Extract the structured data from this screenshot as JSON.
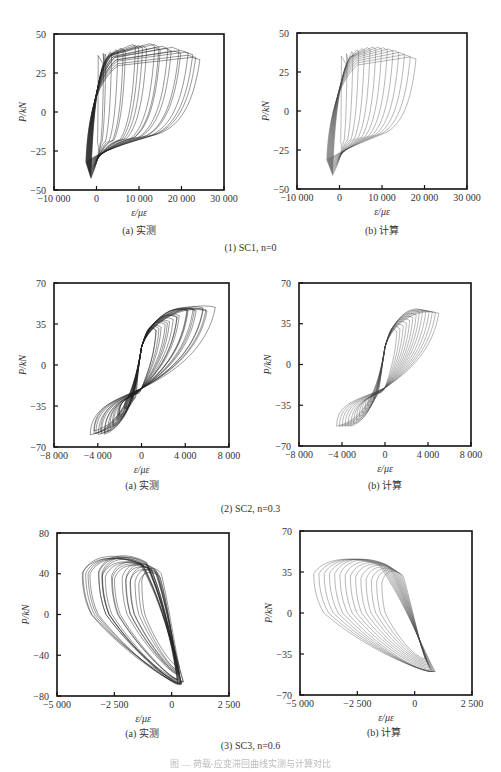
{
  "figure": {
    "groups": [
      {
        "caption": "(1) SC1, n=0"
      },
      {
        "caption": "(2) SC2, n=0.3"
      },
      {
        "caption": "(3) SC3, n=0.6"
      }
    ],
    "bottom_caption": "图 — 荷载-应变滞回曲线实测与计算对比"
  },
  "chart_data": [
    {
      "type": "line",
      "id": "sc1-a",
      "title": "(a) 实测",
      "subtitle": "Measured hysteresis, SC1 n=0",
      "xlabel": "ε/με",
      "ylabel": "P/kN",
      "xlim": [
        -10000,
        30000
      ],
      "ylim": [
        -50,
        50
      ],
      "xticks": [
        "-10 000",
        "0",
        "10 000",
        "20 000",
        "30 000"
      ],
      "xtick_values": [
        -10000,
        0,
        10000,
        20000,
        30000
      ],
      "yticks": [
        "50",
        "25",
        "0",
        "-25",
        "-50"
      ],
      "ytick_values": [
        50,
        25,
        0,
        -25,
        -50
      ],
      "grid": false,
      "legend": null,
      "envelope": {
        "peak_positive_kN": 43,
        "peak_negative_kN": -43,
        "max_strain": 25000,
        "min_strain": -2500
      },
      "loop_peaks": [
        [
          2000,
          37
        ],
        [
          5000,
          39
        ],
        [
          9000,
          40
        ],
        [
          13000,
          43
        ],
        [
          15000,
          38
        ],
        [
          20000,
          40
        ],
        [
          22000,
          37
        ],
        [
          25000,
          39
        ]
      ]
    },
    {
      "type": "line",
      "id": "sc1-b",
      "title": "(b) 计算",
      "subtitle": "Calculated hysteresis, SC1 n=0",
      "xlabel": "ε/με",
      "ylabel": "P/kN",
      "xlim": [
        -10000,
        30000
      ],
      "ylim": [
        -50,
        50
      ],
      "xticks": [
        "-10 000",
        "0",
        "10 000",
        "20 000",
        "30 000"
      ],
      "xtick_values": [
        -10000,
        0,
        10000,
        20000,
        30000
      ],
      "yticks": [
        "50",
        "25",
        "0",
        "-25",
        "-50"
      ],
      "ytick_values": [
        50,
        25,
        0,
        -25,
        -50
      ],
      "grid": false,
      "legend": null,
      "envelope": {
        "peak_positive_kN": 41,
        "peak_negative_kN": -42,
        "max_strain": 18000,
        "min_strain": -3000
      },
      "loop_peaks": [
        [
          4000,
          35
        ],
        [
          6000,
          37
        ],
        [
          8000,
          39
        ],
        [
          10000,
          41
        ],
        [
          12000,
          37
        ],
        [
          14000,
          34
        ],
        [
          16000,
          31
        ],
        [
          18000,
          30
        ]
      ]
    },
    {
      "type": "line",
      "id": "sc2-a",
      "title": "(a) 实测",
      "subtitle": "Measured hysteresis, SC2 n=0.3",
      "xlabel": "ε/με",
      "ylabel": "P/kN",
      "xlim": [
        -8000,
        8000
      ],
      "ylim": [
        -70,
        70
      ],
      "xticks": [
        "-8 000",
        "-4 000",
        "0",
        "4 000",
        "8 000"
      ],
      "xtick_values": [
        -8000,
        -4000,
        0,
        4000,
        8000
      ],
      "yticks": [
        "70",
        "35",
        "0",
        "-35",
        "-70"
      ],
      "ytick_values": [
        70,
        35,
        0,
        -35,
        -70
      ],
      "grid": false,
      "legend": null,
      "envelope": {
        "peak_positive_kN": 53,
        "peak_negative_kN": -58,
        "max_strain": 6500,
        "min_strain": -4600
      }
    },
    {
      "type": "line",
      "id": "sc2-b",
      "title": "(b) 计算",
      "subtitle": "Calculated hysteresis, SC2 n=0.3",
      "xlabel": "ε/με",
      "ylabel": "P/kN",
      "xlim": [
        -8000,
        8000
      ],
      "ylim": [
        -70,
        70
      ],
      "xticks": [
        "-8 000",
        "-4 000",
        "0",
        "4 000",
        "8 000"
      ],
      "xtick_values": [
        -8000,
        -4000,
        0,
        4000,
        8000
      ],
      "yticks": [
        "70",
        "35",
        "0",
        "-35",
        "-70"
      ],
      "ytick_values": [
        70,
        35,
        0,
        -35,
        -70
      ],
      "grid": false,
      "legend": null,
      "envelope": {
        "peak_positive_kN": 52,
        "peak_negative_kN": -53,
        "max_strain": 5000,
        "min_strain": -4500
      }
    },
    {
      "type": "line",
      "id": "sc3-a",
      "title": "(a) 实测",
      "subtitle": "Measured hysteresis, SC3 n=0.6",
      "xlabel": "ε/με",
      "ylabel": "P/kN",
      "xlim": [
        -5000,
        2500
      ],
      "ylim": [
        -80,
        80
      ],
      "xticks": [
        "-5 000",
        "-2 500",
        "0",
        "2 500"
      ],
      "xtick_values": [
        -5000,
        -2500,
        0,
        2500
      ],
      "yticks": [
        "80",
        "40",
        "0",
        "-40",
        "-80"
      ],
      "ytick_values": [
        80,
        40,
        0,
        -40,
        -80
      ],
      "grid": false,
      "legend": null,
      "envelope": {
        "peak_positive_kN": 58,
        "peak_negative_kN": -68,
        "max_strain": 450,
        "min_strain": -4000
      }
    },
    {
      "type": "line",
      "id": "sc3-b",
      "title": "(b) 计算",
      "subtitle": "Calculated hysteresis, SC3 n=0.6",
      "xlabel": "ε/με",
      "ylabel": "P/kN",
      "xlim": [
        -5000,
        2500
      ],
      "ylim": [
        -70,
        70
      ],
      "xticks": [
        "-5 000",
        "-2 500",
        "0",
        "2 500"
      ],
      "xtick_values": [
        -5000,
        -2500,
        0,
        2500
      ],
      "yticks": [
        "70",
        "35",
        "0",
        "-35",
        "-70"
      ],
      "ytick_values": [
        70,
        35,
        0,
        -35,
        -70
      ],
      "grid": false,
      "legend": null,
      "envelope": {
        "peak_positive_kN": 48,
        "peak_negative_kN": -50,
        "max_strain": 900,
        "min_strain": -4400
      }
    }
  ]
}
